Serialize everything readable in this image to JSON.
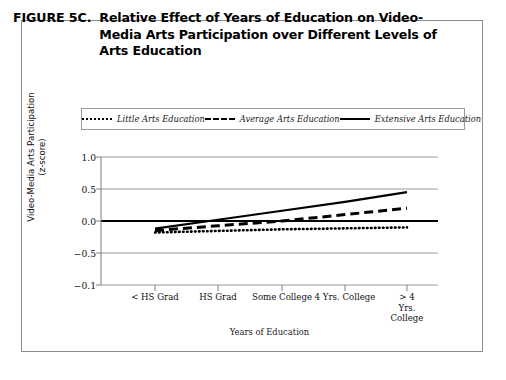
{
  "figure": {
    "label": "FIGURE 5C.",
    "title": "Relative Effect of Years of Education on Video-Media Arts Participation over Different Levels of Arts Education"
  },
  "legend": {
    "position": "top-inside",
    "entries": [
      {
        "name": "little",
        "label": "Little Arts Education",
        "style": "dotted"
      },
      {
        "name": "average",
        "label": "Average Arts Education",
        "style": "dashed"
      },
      {
        "name": "extensive",
        "label": "Extensive Arts Education",
        "style": "solid"
      }
    ]
  },
  "chart_data": {
    "type": "line",
    "title": "Relative Effect of Years of Education on Video-Media Arts Participation over Different Levels of Arts Education",
    "xlabel": "Years of Education",
    "ylabel": "Video-Media Arts Participation (z-score)",
    "ylabel_line1": "Video-Media Arts Participation",
    "ylabel_line2": "(z-score)",
    "categories": [
      "< HS Grad",
      "HS Grad",
      "Some College",
      "4 Yrs. College",
      "> 4 Yrs. College"
    ],
    "category_display": [
      "< HS Grad",
      "HS Grad",
      "Some College",
      "4 Yrs. College",
      "> 4 Yrs.\nCollege"
    ],
    "ytick_labels": [
      "1.0",
      "0.5",
      "0.0",
      "-0.5",
      "-0.1"
    ],
    "ytick_values": [
      1.0,
      0.5,
      0.0,
      -0.5,
      -1.0
    ],
    "ylim": [
      -1.0,
      1.0
    ],
    "grid": true,
    "zero_line_emphasis": true,
    "legend_position": "top-inside",
    "series": [
      {
        "name": "Little Arts Education",
        "style": "dotted",
        "values": [
          -0.18,
          -0.155,
          -0.13,
          -0.115,
          -0.1
        ]
      },
      {
        "name": "Average Arts Education",
        "style": "dashed",
        "values": [
          -0.15,
          -0.075,
          0.0,
          0.1,
          0.2
        ]
      },
      {
        "name": "Extensive Arts Education",
        "style": "solid",
        "values": [
          -0.12,
          0.02,
          0.16,
          0.3,
          0.45
        ]
      }
    ]
  },
  "axis": {
    "x_title": "Years of Education"
  }
}
